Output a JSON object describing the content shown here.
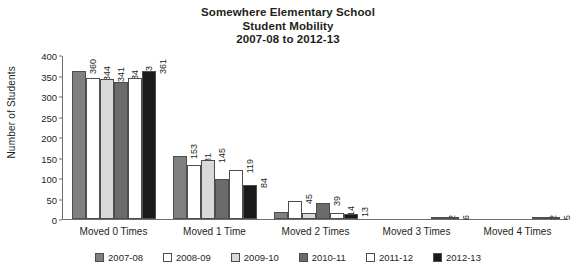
{
  "chart_data": {
    "type": "bar",
    "title": "Somewhere Elementary School Student Mobility 2007-08 to 2012-13",
    "title_lines": [
      "Somewhere Elementary School",
      "Student Mobility",
      "2007-08 to 2012-13"
    ],
    "xlabel": "",
    "ylabel": "Number of Students",
    "ylim": [
      0,
      400
    ],
    "yticks": [
      0,
      50,
      100,
      150,
      200,
      250,
      300,
      350,
      400
    ],
    "grid": false,
    "legend_position": "bottom",
    "categories": [
      "Moved 0 Times",
      "Moved 1 Time",
      "Moved 2 Times",
      "Moved 3 Times",
      "Moved 4 Times"
    ],
    "series": [
      {
        "name": "2007-08",
        "color": "#808080",
        "values": [
          360,
          153,
          16,
          0,
          0
        ]
      },
      {
        "name": "2008-09",
        "color": "#ffffff",
        "values": [
          344,
          131,
          45,
          0,
          0
        ]
      },
      {
        "name": "2009-10",
        "color": "#d9d9d9",
        "values": [
          341,
          145,
          15,
          0,
          0
        ]
      },
      {
        "name": "2010-11",
        "color": "#6b6b6b",
        "values": [
          334,
          98,
          39,
          0,
          0
        ]
      },
      {
        "name": "2011-12",
        "color": "#ffffff",
        "values": [
          343,
          119,
          14,
          2,
          2
        ]
      },
      {
        "name": "2012-13",
        "color": "#1a1a1a",
        "values": [
          361,
          84,
          13,
          6,
          5
        ]
      }
    ]
  }
}
